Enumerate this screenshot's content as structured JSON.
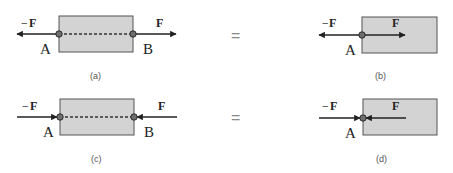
{
  "colors": {
    "block_fill": "#d3d3d3",
    "block_stroke": "#555555",
    "line": "#222222",
    "dot_fill": "#6e6e6e",
    "dot_stroke": "#2a2a2a",
    "equals": "#8a8a8a"
  },
  "panels": {
    "a": {
      "caption": "(a)",
      "neg_force": "−",
      "neg_force_symbol": "F",
      "force": "F",
      "point_left": "A",
      "point_right": "B",
      "arrows": "outward (tension)"
    },
    "b": {
      "caption": "(b)",
      "neg_force": "−",
      "neg_force_symbol": "F",
      "force": "F",
      "point_left": "A",
      "arrows": "outward at single point"
    },
    "c": {
      "caption": "(c)",
      "neg_force": "−",
      "neg_force_symbol": "F",
      "force": "F",
      "point_left": "A",
      "point_right": "B",
      "arrows": "inward (compression)"
    },
    "d": {
      "caption": "(d)",
      "neg_force": "−",
      "neg_force_symbol": "F",
      "force": "F",
      "point_left": "A",
      "arrows": "inward at single point"
    }
  },
  "equals": [
    "=",
    "="
  ]
}
